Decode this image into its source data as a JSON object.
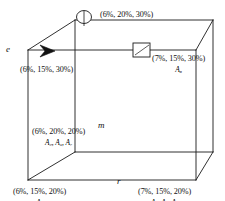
{
  "figure": {
    "type": "3d-cube-diagram",
    "line_color": "#1a1a1a",
    "background": "#ffffff"
  },
  "axes": [
    {
      "name": "e-axis-label",
      "label": "e"
    },
    {
      "name": "m-axis-label",
      "label": "m"
    },
    {
      "name": "r-axis-label",
      "label": "r"
    }
  ],
  "markers": [
    {
      "name": "circle-marker",
      "shape": "circle"
    },
    {
      "name": "square-marker",
      "shape": "square"
    },
    {
      "name": "arrow-marker",
      "shape": "arrowhead"
    }
  ],
  "vertices": [
    {
      "id": "top-back",
      "triple": "(6%, 20%, 30%)",
      "alts": ""
    },
    {
      "id": "top-left-front",
      "triple": "(6%, 15%, 30%)",
      "alts": ""
    },
    {
      "id": "top-right",
      "triple": "(7%, 15%, 30%)",
      "alts": "A₈"
    },
    {
      "id": "mid-back",
      "triple": "(6%, 20%, 20%)",
      "alts": "A₂, A₃, A₇"
    },
    {
      "id": "bottom-left",
      "triple": "(6%, 15%, 20%)",
      "alts": "A₁"
    },
    {
      "id": "bottom-right",
      "triple": "(7%, 15%, 20%)",
      "alts": "A₂, A₄, A₆"
    }
  ]
}
